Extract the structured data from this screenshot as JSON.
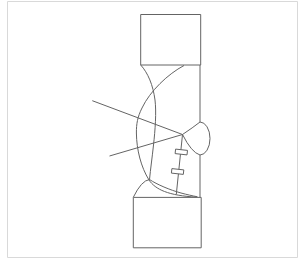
{
  "figure": {
    "kind": "technical-line-drawing",
    "colors": {
      "bg": "#ffffff",
      "border_color": "#d9d9d9",
      "line_color": "#646464"
    },
    "shapes": {
      "page_border": "M 7.5,1.5 H 297.5 V 257.5 H 7.5 Z",
      "top_rect": "M 140.7,14.5 H 200.7 V 65 H 140.7 Z",
      "bottom_rect": "M 133.3,197.4 H 201.2 V 247.8 H 133.3 Z",
      "right_vertical_upper": "M 200,65 V 122",
      "right_vertical_lower": "M 200,155 V 197.4",
      "bump_arc": "M 200,122 A 10 16.5 0 0 1 200,155",
      "tooth_tip": "M 200,122 Q 193,127.5 182.5,134.5 Q 191.5,152.5 200,155",
      "large_arc_left": "M 184,65.5 C 168,74 150,91 142,108 C 137.5,117 136.3,124 136.4,133 C 136.6,150 141,167 149,180 C 155.5,189.5 168,195.5 197,197.2",
      "arc_right": "M 140.7,65 C 148,73 153,85 155,100 C 156.5,112 155.2,130 153.5,145 C 152.2,157.5 150.5,169 149.5,179.5",
      "trochoid_branch": "M 149.5,179.5 C 157,184.5 170,190 181,193 C 187,194.6 192.3,195.8 197.5,196.8",
      "bottom_fillet": "M 133.3,197.3 Q 141.5,180.5 149.5,179.5",
      "pressure_line_upper": "M 92.3,100.7 L 182.5,134.5",
      "pressure_line_lower": "M 109.5,156 L 182.5,134.5",
      "measure_line": "M 182.5,134.5 L 176.3,194.3",
      "tick_1": "M 175.6,149.1 L 187.5,150.4 L 187,154.9 L 175.1,153.6 Z",
      "tick_2": "M 171.9,168.6 L 183.8,169.9 L 183.3,174.4 L 171.4,173.1 Z"
    }
  }
}
